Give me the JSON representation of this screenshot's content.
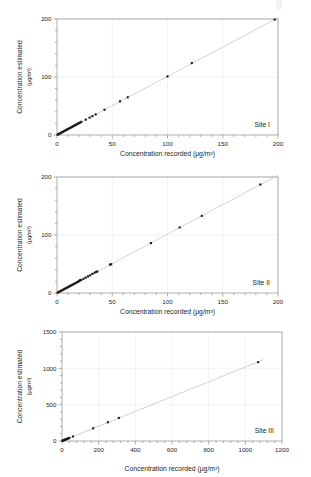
{
  "figure": {
    "background_color": "#ffffff",
    "panel_count": 3,
    "axis_color": "#8c8c8c",
    "grid_color": "#e6e6e6",
    "marker_color": "#1a1a1a",
    "fit_line_color": "#b3b3b3",
    "text_color": "#231f20"
  },
  "axis_titles": {
    "x": "Concentration recorded",
    "y": "Concentration estimated",
    "unit": "(μg/m³)",
    "x_full": "Concentration recorded (μg/m³)"
  },
  "chart_data": [
    {
      "type": "scatter",
      "title": "",
      "annotation": "Site I",
      "xlabel": "Concentration recorded (μg/m³)",
      "ylabel": "Concentration estimated (μg/m³)",
      "xlim": [
        0,
        200
      ],
      "ylim": [
        0,
        200
      ],
      "xticks": [
        0,
        50,
        100,
        150,
        200
      ],
      "yticks": [
        0,
        100,
        200
      ],
      "xtick_labels": [
        "0",
        "50",
        "100",
        "150",
        "200"
      ],
      "ytick_labels": [
        "0",
        "100",
        "200"
      ],
      "grid": true,
      "legend": "none",
      "fit_line": {
        "x": [
          0,
          200
        ],
        "y": [
          0,
          202
        ]
      },
      "points": [
        {
          "x": 0.5,
          "y": 0.5
        },
        {
          "x": 1.2,
          "y": 1.3
        },
        {
          "x": 2.0,
          "y": 2.1
        },
        {
          "x": 2.8,
          "y": 2.9
        },
        {
          "x": 3.6,
          "y": 3.8
        },
        {
          "x": 4.4,
          "y": 4.6
        },
        {
          "x": 5.2,
          "y": 5.4
        },
        {
          "x": 6.0,
          "y": 6.2
        },
        {
          "x": 6.8,
          "y": 7.0
        },
        {
          "x": 7.6,
          "y": 7.9
        },
        {
          "x": 8.4,
          "y": 8.7
        },
        {
          "x": 9.2,
          "y": 9.5
        },
        {
          "x": 10.0,
          "y": 10.3
        },
        {
          "x": 10.8,
          "y": 11.1
        },
        {
          "x": 11.6,
          "y": 12.0
        },
        {
          "x": 12.4,
          "y": 12.8
        },
        {
          "x": 13.2,
          "y": 13.6
        },
        {
          "x": 14.0,
          "y": 14.4
        },
        {
          "x": 14.8,
          "y": 15.3
        },
        {
          "x": 15.6,
          "y": 16.1
        },
        {
          "x": 16.4,
          "y": 16.9
        },
        {
          "x": 17.2,
          "y": 17.7
        },
        {
          "x": 18.0,
          "y": 18.6
        },
        {
          "x": 18.8,
          "y": 19.4
        },
        {
          "x": 19.6,
          "y": 20.2
        },
        {
          "x": 20.4,
          "y": 21.0
        },
        {
          "x": 21.2,
          "y": 21.9
        },
        {
          "x": 22.0,
          "y": 22.7
        },
        {
          "x": 26.0,
          "y": 26.5
        },
        {
          "x": 29.5,
          "y": 30.0
        },
        {
          "x": 32.0,
          "y": 32.5
        },
        {
          "x": 35.0,
          "y": 35.5
        },
        {
          "x": 43.0,
          "y": 43.5
        },
        {
          "x": 57.0,
          "y": 58.0
        },
        {
          "x": 64.0,
          "y": 65.0
        },
        {
          "x": 100.0,
          "y": 101.0
        },
        {
          "x": 122.0,
          "y": 124.0
        },
        {
          "x": 197.0,
          "y": 199.0
        }
      ]
    },
    {
      "type": "scatter",
      "title": "",
      "annotation": "Site II",
      "xlabel": "Concentration recorded (μg/m³)",
      "ylabel": "Concentration estimated (μg/m³)",
      "xlim": [
        0,
        200
      ],
      "ylim": [
        0,
        200
      ],
      "xticks": [
        0,
        50,
        100,
        150,
        200
      ],
      "yticks": [
        0,
        100,
        200
      ],
      "xtick_labels": [
        "0",
        "50",
        "100",
        "150",
        "200"
      ],
      "ytick_labels": [
        "0",
        "100",
        "200"
      ],
      "grid": true,
      "legend": "none",
      "fit_line": {
        "x": [
          0,
          200
        ],
        "y": [
          0,
          203
        ]
      },
      "points": [
        {
          "x": 0.6,
          "y": 0.6
        },
        {
          "x": 1.5,
          "y": 1.6
        },
        {
          "x": 2.4,
          "y": 2.5
        },
        {
          "x": 3.3,
          "y": 3.4
        },
        {
          "x": 4.2,
          "y": 4.3
        },
        {
          "x": 5.1,
          "y": 5.2
        },
        {
          "x": 6.0,
          "y": 6.2
        },
        {
          "x": 6.9,
          "y": 7.1
        },
        {
          "x": 7.8,
          "y": 8.0
        },
        {
          "x": 8.7,
          "y": 8.9
        },
        {
          "x": 9.6,
          "y": 9.8
        },
        {
          "x": 10.5,
          "y": 10.7
        },
        {
          "x": 11.4,
          "y": 11.7
        },
        {
          "x": 12.3,
          "y": 12.6
        },
        {
          "x": 13.2,
          "y": 13.5
        },
        {
          "x": 14.1,
          "y": 14.4
        },
        {
          "x": 15.0,
          "y": 15.3
        },
        {
          "x": 16.0,
          "y": 16.3
        },
        {
          "x": 17.0,
          "y": 17.4
        },
        {
          "x": 18.0,
          "y": 18.4
        },
        {
          "x": 19.0,
          "y": 19.4
        },
        {
          "x": 20.0,
          "y": 20.5
        },
        {
          "x": 20.5,
          "y": 21.5
        },
        {
          "x": 21.0,
          "y": 22.0
        },
        {
          "x": 22.0,
          "y": 22.5
        },
        {
          "x": 24.0,
          "y": 24.5
        },
        {
          "x": 26.0,
          "y": 26.5
        },
        {
          "x": 28.0,
          "y": 28.5
        },
        {
          "x": 30.0,
          "y": 30.5
        },
        {
          "x": 32.0,
          "y": 33.0
        },
        {
          "x": 34.0,
          "y": 35.0
        },
        {
          "x": 35.5,
          "y": 36.5
        },
        {
          "x": 36.5,
          "y": 37.0
        },
        {
          "x": 48.0,
          "y": 49.0
        },
        {
          "x": 49.0,
          "y": 49.5
        },
        {
          "x": 85.0,
          "y": 86.0
        },
        {
          "x": 111.0,
          "y": 113.0
        },
        {
          "x": 131.0,
          "y": 133.0
        },
        {
          "x": 184.0,
          "y": 187.0
        }
      ]
    },
    {
      "type": "scatter",
      "title": "",
      "annotation": "Site III",
      "xlabel": "Concentration recorded (μg/m³)",
      "ylabel": "Concentration estimated (μg/m³)",
      "xlim": [
        0,
        1200
      ],
      "ylim": [
        0,
        1500
      ],
      "xticks": [
        0,
        200,
        400,
        600,
        800,
        1000,
        1200
      ],
      "yticks": [
        0,
        500,
        1000,
        1500
      ],
      "xtick_labels": [
        "0",
        "200",
        "400",
        "600",
        "800",
        "1000",
        "1200"
      ],
      "ytick_labels": [
        "0",
        "500",
        "1000",
        "1500"
      ],
      "grid": true,
      "legend": "none",
      "fit_line": {
        "x": [
          0,
          1100
        ],
        "y": [
          0,
          1120
        ]
      },
      "points": [
        {
          "x": 2,
          "y": 3
        },
        {
          "x": 5,
          "y": 6
        },
        {
          "x": 8,
          "y": 9
        },
        {
          "x": 11,
          "y": 13
        },
        {
          "x": 14,
          "y": 16
        },
        {
          "x": 17,
          "y": 19
        },
        {
          "x": 20,
          "y": 22
        },
        {
          "x": 24,
          "y": 26
        },
        {
          "x": 28,
          "y": 30
        },
        {
          "x": 32,
          "y": 34
        },
        {
          "x": 36,
          "y": 38
        },
        {
          "x": 40,
          "y": 43
        },
        {
          "x": 60,
          "y": 62
        },
        {
          "x": 170,
          "y": 175
        },
        {
          "x": 250,
          "y": 258
        },
        {
          "x": 310,
          "y": 318
        },
        {
          "x": 1070,
          "y": 1085
        }
      ]
    }
  ],
  "panels": [
    {
      "index": 0,
      "site": "Site I"
    },
    {
      "index": 1,
      "site": "Site II"
    },
    {
      "index": 2,
      "site": "Site III"
    }
  ]
}
